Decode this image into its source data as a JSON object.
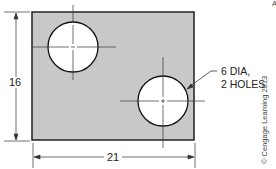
{
  "drawing": {
    "plate": {
      "x": 32,
      "y": 12,
      "width": 162,
      "height": 128,
      "fill": "#c8c8c8",
      "stroke": "#222222"
    },
    "holes": [
      {
        "cx": 73,
        "cy": 47,
        "r": 25
      },
      {
        "cx": 163,
        "cy": 101,
        "r": 25
      }
    ],
    "height_dimension": {
      "label": "16"
    },
    "width_dimension": {
      "label": "21"
    },
    "hole_note": {
      "line1": "6 DIA,",
      "line2": "2 HOLES"
    },
    "credit": "© Cengage Learning 2013",
    "corner_mark": "A"
  }
}
